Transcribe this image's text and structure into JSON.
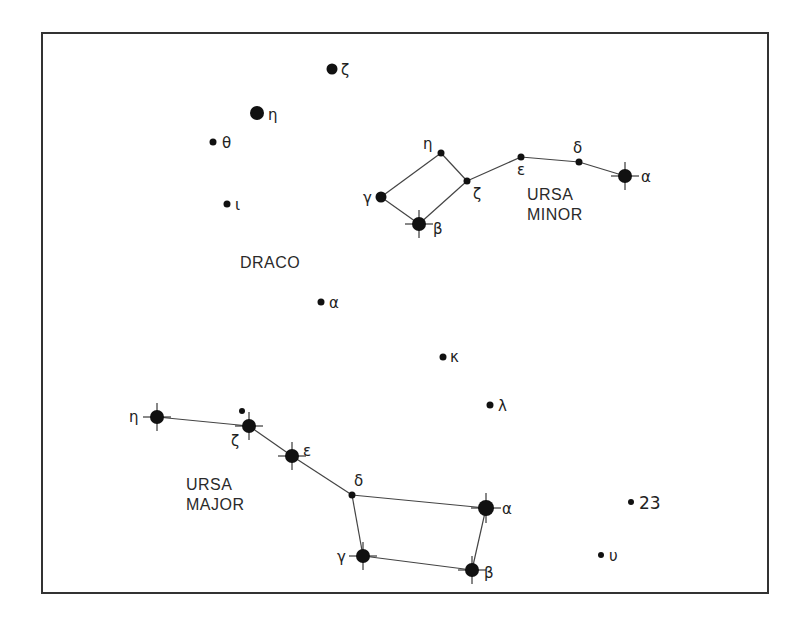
{
  "frame": {
    "x": 42,
    "y": 33,
    "width": 726,
    "height": 560,
    "stroke": "#333333"
  },
  "colors": {
    "star": "#111111",
    "line": "#444444",
    "text": "#222222"
  },
  "constellations": [
    {
      "name": "DRACO",
      "label_lines": [
        "DRACO"
      ],
      "label_pos": [
        240,
        268
      ]
    },
    {
      "name": "URSA MINOR",
      "label_lines": [
        "URSA",
        "MINOR"
      ],
      "label_pos": [
        527,
        200
      ]
    },
    {
      "name": "URSA MAJOR",
      "label_lines": [
        "URSA",
        "MAJOR"
      ],
      "label_pos": [
        186,
        490
      ]
    }
  ],
  "labels": {
    "draco": "DRACO",
    "ursa_minor_1": "URSA",
    "ursa_minor_2": "MINOR",
    "ursa_major_1": "URSA",
    "ursa_major_2": "MAJOR"
  },
  "stars": [
    {
      "id": "dra-zeta",
      "constellation": "DRACO",
      "label": "ζ",
      "x": 332,
      "y": 69,
      "r": 5.5,
      "spikes": false
    },
    {
      "id": "dra-eta",
      "constellation": "DRACO",
      "label": "η",
      "x": 257,
      "y": 113,
      "r": 7,
      "spikes": false
    },
    {
      "id": "dra-theta",
      "constellation": "DRACO",
      "label": "θ",
      "x": 213,
      "y": 142,
      "r": 3.5,
      "spikes": false
    },
    {
      "id": "dra-iota",
      "constellation": "DRACO",
      "label": "ι",
      "x": 227,
      "y": 204,
      "r": 3.5,
      "spikes": false
    },
    {
      "id": "dra-alpha",
      "constellation": "DRACO",
      "label": "α",
      "x": 321,
      "y": 302,
      "r": 3.5,
      "spikes": false
    },
    {
      "id": "dra-kappa",
      "constellation": "DRACO",
      "label": "κ",
      "x": 443,
      "y": 357,
      "r": 3.5,
      "spikes": false
    },
    {
      "id": "dra-lambda",
      "constellation": "DRACO",
      "label": "λ",
      "x": 490,
      "y": 405,
      "r": 3.5,
      "spikes": false
    },
    {
      "id": "umi-eta",
      "constellation": "URSA MINOR",
      "label": "η",
      "x": 441,
      "y": 153,
      "r": 3.5,
      "spikes": false
    },
    {
      "id": "umi-zeta",
      "constellation": "URSA MINOR",
      "label": "ζ",
      "x": 467,
      "y": 181,
      "r": 3.5,
      "spikes": false
    },
    {
      "id": "umi-gamma",
      "constellation": "URSA MINOR",
      "label": "γ",
      "x": 381,
      "y": 197,
      "r": 5.5,
      "spikes": false
    },
    {
      "id": "umi-beta",
      "constellation": "URSA MINOR",
      "label": "β",
      "x": 419,
      "y": 224,
      "r": 7,
      "spikes": true
    },
    {
      "id": "umi-epsilon",
      "constellation": "URSA MINOR",
      "label": "ε",
      "x": 521,
      "y": 157,
      "r": 3.5,
      "spikes": false
    },
    {
      "id": "umi-delta",
      "constellation": "URSA MINOR",
      "label": "δ",
      "x": 579,
      "y": 162,
      "r": 3.5,
      "spikes": false
    },
    {
      "id": "umi-alpha",
      "constellation": "URSA MINOR",
      "label": "α",
      "x": 625,
      "y": 176,
      "r": 7,
      "spikes": true
    },
    {
      "id": "uma-eta",
      "constellation": "URSA MAJOR",
      "label": "η",
      "x": 157,
      "y": 417,
      "r": 7,
      "spikes": true
    },
    {
      "id": "uma-alcor",
      "constellation": "URSA MAJOR",
      "label": "",
      "x": 242,
      "y": 411,
      "r": 3,
      "spikes": false
    },
    {
      "id": "uma-zeta",
      "constellation": "URSA MAJOR",
      "label": "ζ",
      "x": 249,
      "y": 426,
      "r": 7,
      "spikes": true
    },
    {
      "id": "uma-epsilon",
      "constellation": "URSA MAJOR",
      "label": "ε",
      "x": 292,
      "y": 456,
      "r": 7,
      "spikes": true
    },
    {
      "id": "uma-delta",
      "constellation": "URSA MAJOR",
      "label": "δ",
      "x": 352,
      "y": 495,
      "r": 3.5,
      "spikes": false
    },
    {
      "id": "uma-alpha",
      "constellation": "URSA MAJOR",
      "label": "α",
      "x": 486,
      "y": 508,
      "r": 8,
      "spikes": true
    },
    {
      "id": "uma-gamma",
      "constellation": "URSA MAJOR",
      "label": "γ",
      "x": 363,
      "y": 556,
      "r": 7,
      "spikes": true
    },
    {
      "id": "uma-beta",
      "constellation": "URSA MAJOR",
      "label": "β",
      "x": 472,
      "y": 570,
      "r": 7,
      "spikes": true
    },
    {
      "id": "uma-23",
      "constellation": "URSA MAJOR",
      "label": "23",
      "x": 631,
      "y": 502,
      "r": 3,
      "spikes": false
    },
    {
      "id": "uma-upsilon",
      "constellation": "URSA MAJOR",
      "label": "υ",
      "x": 601,
      "y": 555,
      "r": 3,
      "spikes": false
    }
  ],
  "lines": [
    [
      "umi-gamma",
      "umi-eta"
    ],
    [
      "umi-eta",
      "umi-zeta"
    ],
    [
      "umi-zeta",
      "umi-beta"
    ],
    [
      "umi-beta",
      "umi-gamma"
    ],
    [
      "umi-zeta",
      "umi-epsilon"
    ],
    [
      "umi-epsilon",
      "umi-delta"
    ],
    [
      "umi-delta",
      "umi-alpha"
    ],
    [
      "uma-eta",
      "uma-zeta"
    ],
    [
      "uma-zeta",
      "uma-epsilon"
    ],
    [
      "uma-epsilon",
      "uma-delta"
    ],
    [
      "uma-delta",
      "uma-alpha"
    ],
    [
      "uma-alpha",
      "uma-beta"
    ],
    [
      "uma-beta",
      "uma-gamma"
    ],
    [
      "uma-gamma",
      "uma-delta"
    ]
  ]
}
